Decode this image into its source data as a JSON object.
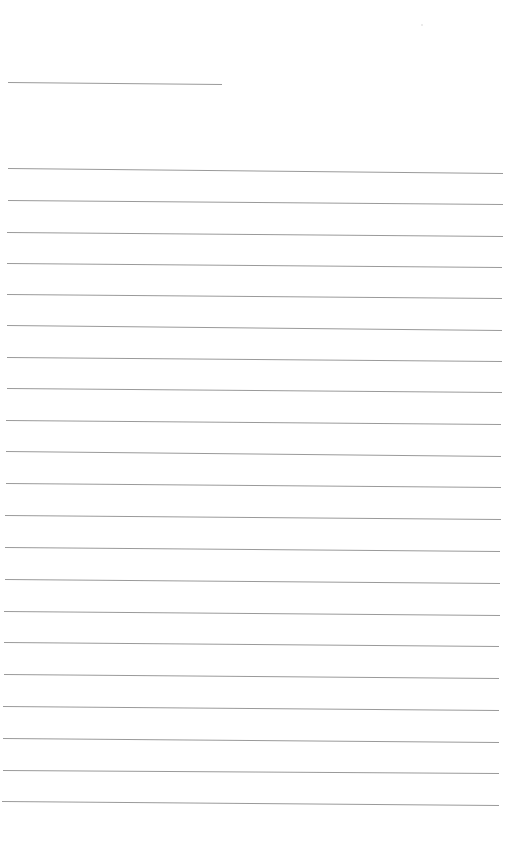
{
  "document": {
    "type": "blank-lined-sheet",
    "background_color": "#ffffff",
    "line_color": "#9a9a9a",
    "line_width": 1,
    "header_line": {
      "x1": 8,
      "y1": 82,
      "x2": 222,
      "y2": 84
    },
    "ruled_lines": [
      {
        "x1": 8,
        "y1": 168,
        "x2": 503,
        "y2": 173
      },
      {
        "x1": 8,
        "y1": 200,
        "x2": 503,
        "y2": 204
      },
      {
        "x1": 7,
        "y1": 232,
        "x2": 503,
        "y2": 236
      },
      {
        "x1": 7,
        "y1": 263,
        "x2": 502,
        "y2": 267
      },
      {
        "x1": 7,
        "y1": 294,
        "x2": 502,
        "y2": 298
      },
      {
        "x1": 7,
        "y1": 325,
        "x2": 502,
        "y2": 330
      },
      {
        "x1": 7,
        "y1": 357,
        "x2": 502,
        "y2": 361
      },
      {
        "x1": 7,
        "y1": 388,
        "x2": 502,
        "y2": 392
      },
      {
        "x1": 6,
        "y1": 420,
        "x2": 501,
        "y2": 424
      },
      {
        "x1": 6,
        "y1": 451,
        "x2": 501,
        "y2": 456
      },
      {
        "x1": 6,
        "y1": 483,
        "x2": 501,
        "y2": 487
      },
      {
        "x1": 5,
        "y1": 515,
        "x2": 501,
        "y2": 519
      },
      {
        "x1": 5,
        "y1": 547,
        "x2": 500,
        "y2": 551
      },
      {
        "x1": 5,
        "y1": 579,
        "x2": 500,
        "y2": 583
      },
      {
        "x1": 4,
        "y1": 611,
        "x2": 500,
        "y2": 615
      },
      {
        "x1": 4,
        "y1": 642,
        "x2": 499,
        "y2": 646
      },
      {
        "x1": 4,
        "y1": 674,
        "x2": 499,
        "y2": 678
      },
      {
        "x1": 3,
        "y1": 706,
        "x2": 499,
        "y2": 710
      },
      {
        "x1": 3,
        "y1": 738,
        "x2": 499,
        "y2": 742
      },
      {
        "x1": 3,
        "y1": 770,
        "x2": 499,
        "y2": 773
      },
      {
        "x1": 2,
        "y1": 801,
        "x2": 499,
        "y2": 805
      }
    ]
  }
}
